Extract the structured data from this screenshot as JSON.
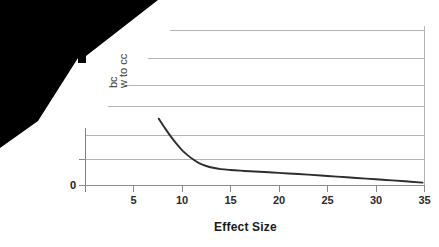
{
  "chart_data": {
    "type": "line",
    "title": "",
    "xlabel": "Effect Size",
    "ylabel_fragment_1": "bc",
    "ylabel_fragment_2": "w to cc",
    "xticks": [
      5,
      10,
      15,
      20,
      25,
      30,
      35
    ],
    "xtick_labels": [
      "5",
      "10",
      "15",
      "20",
      "25",
      "30",
      "35"
    ],
    "yticks": [
      0
    ],
    "ytick_labels": [
      "0"
    ],
    "xlim": [
      0,
      39
    ],
    "ylim": [
      0,
      7
    ],
    "grid": "horizontal",
    "gridline_count": 7,
    "legend": "none",
    "series": [
      {
        "name": "decay-curve",
        "color": "#2e2e2e",
        "x": [
          7.6,
          8.2,
          8.8,
          9.4,
          10.0,
          10.6,
          11.2,
          11.8,
          12.5,
          13.2,
          14.0,
          15.0,
          16.0,
          17.0,
          18.0,
          19.0,
          20.0,
          21.5,
          23.0,
          25.0,
          27.0,
          29.0,
          31.0,
          33.0,
          34.8
        ],
        "y": [
          3.02,
          2.62,
          2.24,
          1.9,
          1.6,
          1.36,
          1.16,
          1.0,
          0.88,
          0.8,
          0.74,
          0.7,
          0.67,
          0.645,
          0.62,
          0.595,
          0.57,
          0.53,
          0.49,
          0.43,
          0.37,
          0.31,
          0.25,
          0.19,
          0.13
        ]
      }
    ]
  },
  "axis": {
    "x_title": "Effect Size",
    "y_zero_label": "0"
  },
  "overlay": {
    "name": "black-occlusion-region",
    "color": "#000000"
  }
}
